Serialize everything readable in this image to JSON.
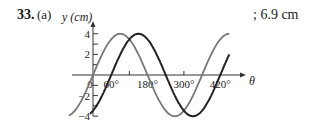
{
  "problem": {
    "number": "33.",
    "part": "(a)",
    "answer": "; 6.9 cm"
  },
  "chart_data": {
    "type": "line",
    "title": "",
    "xlabel": "θ",
    "ylabel": "y (cm)",
    "x_unit": "degrees",
    "xlim": [
      -80,
      460
    ],
    "ylim": [
      -4,
      4
    ],
    "x_tick_labels": [
      "0",
      "60°",
      "180°",
      "300°",
      "420°"
    ],
    "x_tick_values": [
      0,
      60,
      180,
      300,
      420
    ],
    "x_minor_ticks": [
      120,
      300
    ],
    "y_tick_labels": [
      "4",
      "2",
      "−2",
      "−4"
    ],
    "y_tick_values": [
      4,
      2,
      -2,
      -4
    ],
    "y_minor_ticks": [
      3,
      1,
      -1,
      -3
    ],
    "series": [
      {
        "name": "y1 = 4 sin θ",
        "color": "#777777",
        "amplitude": 4,
        "phase_deg": 0,
        "x_range": [
          -80,
          450
        ],
        "x": [
          -80,
          -60,
          0,
          90,
          180,
          270,
          360,
          450
        ],
        "values": [
          -3.94,
          -3.46,
          0,
          4,
          0,
          -4,
          0,
          4
        ]
      },
      {
        "name": "y2 = 4 sin(θ − 60°)",
        "color": "#222222",
        "amplitude": 4,
        "phase_deg": 60,
        "x_range": [
          -10,
          450
        ],
        "x": [
          -10,
          60,
          150,
          240,
          330,
          420,
          450
        ],
        "values": [
          -3.76,
          0,
          4,
          0,
          -4,
          0,
          2
        ]
      }
    ],
    "grid": false,
    "legend": "none"
  },
  "geometry": {
    "origin_x": 93,
    "origin_y": 75,
    "px_per_deg": 0.303,
    "px_per_unit": 10.3
  }
}
